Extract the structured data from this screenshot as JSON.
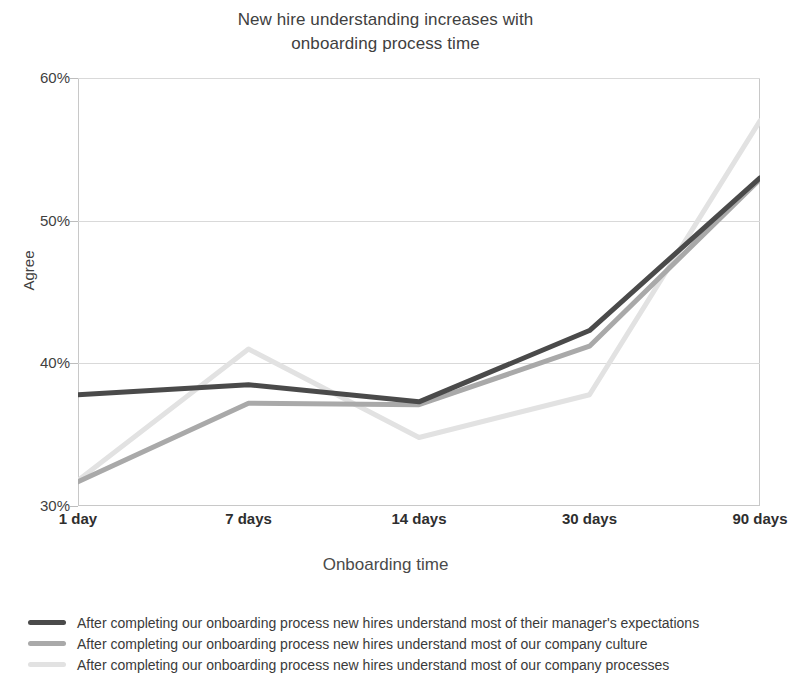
{
  "chart_data": {
    "type": "line",
    "title": "New hire understanding increases with\nonboarding process time",
    "xlabel": "Onboarding time",
    "ylabel": "Agree",
    "categories": [
      "1 day",
      "7 days",
      "14 days",
      "30 days",
      "90 days"
    ],
    "yticks": [
      "30%",
      "40%",
      "50%",
      "60%"
    ],
    "ytick_values": [
      30,
      40,
      50,
      60
    ],
    "ylim": [
      30,
      60
    ],
    "grid": true,
    "legend_position": "below",
    "series": [
      {
        "name": "After completing our onboarding process new hires understand most of their manager's expectations",
        "color": "#4a4a4a",
        "values": [
          37.8,
          38.5,
          37.3,
          42.3,
          53.0
        ]
      },
      {
        "name": "After completing our onboarding process new hires understand most of our company culture",
        "color": "#a9a9a9",
        "values": [
          31.7,
          37.2,
          37.1,
          41.2,
          52.9
        ]
      },
      {
        "name": "After completing our onboarding process new hires understand most of our company processes",
        "color": "#e2e2e2",
        "values": [
          31.8,
          41.0,
          34.8,
          37.8,
          57.0
        ]
      }
    ]
  }
}
